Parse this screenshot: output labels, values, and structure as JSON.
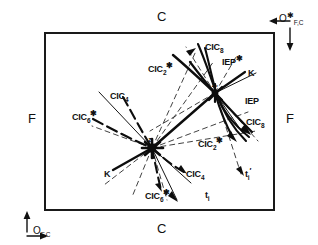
{
  "figure": {
    "type": "phase-diagram",
    "frame": {
      "x": 45,
      "y": 33,
      "width": 229,
      "height": 177
    },
    "edge_labels": {
      "top": "C",
      "bottom": "C",
      "left": "F",
      "right": "F"
    },
    "origins": [
      {
        "name": "origin-bottom-left",
        "symbol": "O",
        "sub": "F,C",
        "sup": "",
        "arrow_h": "⟶",
        "arrow_v": "↑",
        "x": 10,
        "y": 219
      },
      {
        "name": "origin-top-right",
        "symbol": "O",
        "sub": "F,C",
        "sup": "✱",
        "arrow_h": "⟵",
        "arrow_v": "↓",
        "x": 279,
        "y": 16
      }
    ],
    "nodes": [
      {
        "id": "z",
        "label": "z",
        "x": 152,
        "y": 148
      },
      {
        "id": "z1",
        "label": "z₁",
        "x": 215,
        "y": 93
      }
    ],
    "annotations": [
      {
        "id": "cic8-top",
        "base": "CIC",
        "sub": "8",
        "sup": "",
        "x": 205,
        "y": 44
      },
      {
        "id": "iep-star",
        "base": "IEP",
        "sub": "",
        "sup": "✱",
        "x": 222,
        "y": 59
      },
      {
        "id": "k-upper",
        "base": "K",
        "sub": "",
        "sup": "",
        "x": 248,
        "y": 70
      },
      {
        "id": "cic2-star-upper",
        "base": "CIC",
        "sub": "2",
        "sup": "✱",
        "x": 150,
        "y": 66
      },
      {
        "id": "iep",
        "base": "IEP",
        "sub": "",
        "sup": "",
        "x": 245,
        "y": 98
      },
      {
        "id": "cic8-right",
        "base": "CIC",
        "sub": "8",
        "sup": "",
        "x": 246,
        "y": 119
      },
      {
        "id": "cic4-upper",
        "base": "CIC",
        "sub": "4",
        "sup": "",
        "x": 110,
        "y": 93
      },
      {
        "id": "cic6-star-left",
        "base": "CIC",
        "sub": "6",
        "sup": "✱",
        "x": 76,
        "y": 114
      },
      {
        "id": "cic2-star-lower",
        "base": "CIC",
        "sub": "2",
        "sup": "✱",
        "x": 200,
        "y": 141
      },
      {
        "id": "k-lower",
        "base": "K",
        "sub": "",
        "sup": "",
        "x": 105,
        "y": 170
      },
      {
        "id": "cic4-lower",
        "base": "CIC",
        "sub": "4",
        "sup": "",
        "x": 186,
        "y": 171
      },
      {
        "id": "ti-prime",
        "base": "t",
        "sub": "i",
        "sup": "′",
        "x": 245,
        "y": 171
      },
      {
        "id": "cic6-star-lower",
        "base": "CIC",
        "sub": "6",
        "sup": "✱",
        "x": 147,
        "y": 193
      },
      {
        "id": "ti",
        "base": "t",
        "sub": "i",
        "sup": "",
        "x": 205,
        "y": 192
      }
    ],
    "colors": {
      "ink": "#111111",
      "background": "#ffffff"
    }
  }
}
